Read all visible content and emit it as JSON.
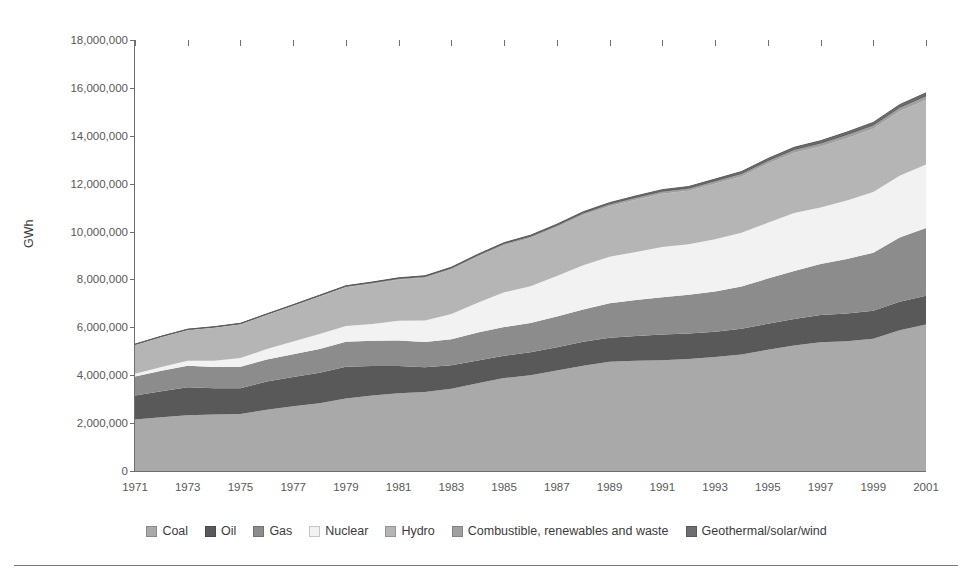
{
  "axis": {
    "ylabel": "GWh",
    "yticks": [
      "0",
      "2,000,000",
      "4,000,000",
      "6,000,000",
      "8,000,000",
      "10,000,000",
      "12,000,000",
      "14,000,000",
      "16,000,000",
      "18,000,000"
    ],
    "xticks": [
      "1971",
      "1973",
      "1975",
      "1977",
      "1979",
      "1981",
      "1983",
      "1985",
      "1987",
      "1989",
      "1991",
      "1993",
      "1995",
      "1997",
      "1999",
      "2001"
    ]
  },
  "legend": [
    {
      "label": "Coal",
      "color": "#a9a9a9"
    },
    {
      "label": "Oil",
      "color": "#595959"
    },
    {
      "label": "Gas",
      "color": "#8c8c8c"
    },
    {
      "label": "Nuclear",
      "color": "#f2f2f2"
    },
    {
      "label": "Hydro",
      "color": "#b5b5b5"
    },
    {
      "label": "Combustible, renewables and waste",
      "color": "#a0a0a0"
    },
    {
      "label": "Geothermal/solar/wind",
      "color": "#6e6e6e"
    }
  ],
  "chart_data": {
    "type": "area",
    "stacked": true,
    "xlabel": "",
    "ylabel": "GWh",
    "ylim": [
      0,
      18000000
    ],
    "xlim": [
      1971,
      2001
    ],
    "grid": false,
    "legend_position": "bottom",
    "x": [
      1971,
      1972,
      1973,
      1974,
      1975,
      1976,
      1977,
      1978,
      1979,
      1980,
      1981,
      1982,
      1983,
      1984,
      1985,
      1986,
      1987,
      1988,
      1989,
      1990,
      1991,
      1992,
      1993,
      1994,
      1995,
      1996,
      1997,
      1998,
      1999,
      2000,
      2001
    ],
    "series": [
      {
        "name": "Coal",
        "color": "#a9a9a9",
        "values": [
          2150000,
          2250000,
          2330000,
          2360000,
          2380000,
          2560000,
          2700000,
          2830000,
          3030000,
          3150000,
          3250000,
          3300000,
          3440000,
          3660000,
          3880000,
          4000000,
          4200000,
          4400000,
          4560000,
          4600000,
          4630000,
          4680000,
          4760000,
          4870000,
          5060000,
          5240000,
          5380000,
          5420000,
          5520000,
          5880000,
          6120000
        ]
      },
      {
        "name": "Oil",
        "color": "#595959",
        "values": [
          1000000,
          1080000,
          1170000,
          1100000,
          1080000,
          1180000,
          1230000,
          1270000,
          1320000,
          1230000,
          1130000,
          1030000,
          980000,
          960000,
          930000,
          960000,
          970000,
          1000000,
          1010000,
          1040000,
          1070000,
          1060000,
          1060000,
          1070000,
          1090000,
          1110000,
          1140000,
          1160000,
          1170000,
          1190000,
          1200000
        ]
      },
      {
        "name": "Gas",
        "color": "#8c8c8c",
        "values": [
          800000,
          860000,
          900000,
          880000,
          890000,
          920000,
          950000,
          990000,
          1050000,
          1060000,
          1070000,
          1060000,
          1080000,
          1160000,
          1200000,
          1220000,
          1280000,
          1350000,
          1440000,
          1500000,
          1560000,
          1620000,
          1680000,
          1770000,
          1890000,
          2000000,
          2120000,
          2270000,
          2430000,
          2680000,
          2830000
        ]
      },
      {
        "name": "Nuclear",
        "color": "#f2f2f2",
        "values": [
          110000,
          150000,
          200000,
          260000,
          370000,
          430000,
          530000,
          630000,
          660000,
          700000,
          820000,
          900000,
          1060000,
          1250000,
          1450000,
          1540000,
          1690000,
          1840000,
          1940000,
          2010000,
          2090000,
          2110000,
          2180000,
          2240000,
          2330000,
          2420000,
          2360000,
          2450000,
          2530000,
          2580000,
          2650000
        ]
      },
      {
        "name": "Hydro",
        "color": "#b5b5b5",
        "values": [
          1200000,
          1250000,
          1280000,
          1380000,
          1400000,
          1420000,
          1480000,
          1560000,
          1610000,
          1680000,
          1720000,
          1780000,
          1860000,
          1920000,
          1970000,
          2010000,
          2040000,
          2100000,
          2110000,
          2180000,
          2230000,
          2230000,
          2320000,
          2350000,
          2460000,
          2520000,
          2550000,
          2600000,
          2640000,
          2690000,
          2700000
        ]
      },
      {
        "name": "Combustible, renewables and waste",
        "color": "#a0a0a0",
        "values": [
          30000,
          32000,
          34000,
          36000,
          38000,
          41000,
          44000,
          47000,
          50000,
          54000,
          58000,
          62000,
          66000,
          71000,
          76000,
          81000,
          87000,
          93000,
          99000,
          106000,
          112000,
          118000,
          124000,
          130000,
          137000,
          143000,
          150000,
          157000,
          163000,
          170000,
          176000
        ]
      },
      {
        "name": "Geothermal/solar/wind",
        "color": "#6e6e6e",
        "values": [
          6000,
          7000,
          8000,
          9000,
          10000,
          11000,
          12000,
          14000,
          16000,
          18000,
          20000,
          22000,
          25000,
          28000,
          31000,
          35000,
          39000,
          43000,
          48000,
          53000,
          58000,
          63000,
          68000,
          74000,
          80000,
          86000,
          92000,
          98000,
          104000,
          110000,
          116000
        ]
      }
    ]
  }
}
